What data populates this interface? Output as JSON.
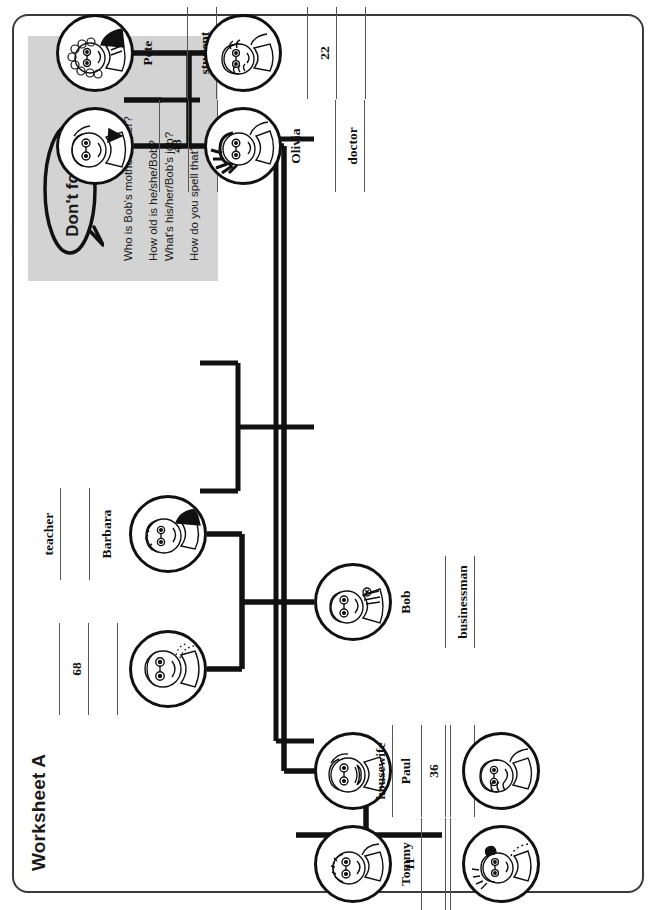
{
  "page": {
    "title": "Worksheet A"
  },
  "reminder_box": {
    "bubble_label": "Don't forget!",
    "questions": [
      "Who is Bob's mother/father?",
      "How old is he/she/Bob?",
      "What's his/her/Bob's job?",
      "How do you spell that?"
    ],
    "background_color": "#d3d3d3"
  },
  "family_tree": {
    "people": {
      "grandfather": {
        "name": "",
        "age": "68",
        "job": "",
        "avatar": "old-man-face-icon"
      },
      "grandmother": {
        "name": "Barbara",
        "age": "",
        "job": "teacher",
        "avatar": "old-woman-face-icon"
      },
      "olivia": {
        "name": "Olivia",
        "age": "",
        "job": "doctor",
        "avatar": "woman-spiky-hair-face-icon"
      },
      "olivia_spouse": {
        "name": "",
        "age": "48",
        "job": "",
        "avatar": "man-face-icon"
      },
      "pete": {
        "name": "Pete",
        "age": "",
        "job": "student",
        "avatar": "boy-curly-hair-face-icon"
      },
      "pete_sibling": {
        "name": "",
        "age": "22",
        "job": "",
        "avatar": "young-woman-face-icon"
      },
      "bob": {
        "name": "Bob",
        "age": "",
        "job": "businessman",
        "avatar": "man-suit-face-icon"
      },
      "paul": {
        "name": "Paul",
        "age": "36",
        "job": "",
        "avatar": "man-moustache-face-icon"
      },
      "paul_spouse": {
        "name": "",
        "age": "",
        "job": "housewife",
        "avatar": "woman-face-icon"
      },
      "tommy": {
        "name": "Tommy",
        "age": "",
        "job": "",
        "avatar": "boy-face-icon"
      },
      "tommy_sibling": {
        "name": "",
        "age": "11",
        "job": "",
        "avatar": "girl-pigtails-face-icon"
      }
    }
  }
}
